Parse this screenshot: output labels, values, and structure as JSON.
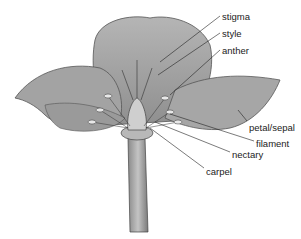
{
  "diagram": {
    "labels": [
      {
        "id": "stigma",
        "text": "stigma",
        "x": 222,
        "y": 12
      },
      {
        "id": "style",
        "text": "style",
        "x": 222,
        "y": 29
      },
      {
        "id": "anther",
        "text": "anther",
        "x": 222,
        "y": 46
      },
      {
        "id": "petal-sepal",
        "text": "petal/sepal",
        "x": 249,
        "y": 123
      },
      {
        "id": "filament",
        "text": "filament",
        "x": 256,
        "y": 139
      },
      {
        "id": "nectary",
        "text": "nectary",
        "x": 232,
        "y": 150
      },
      {
        "id": "carpel",
        "text": "carpel",
        "x": 206,
        "y": 167
      }
    ]
  }
}
